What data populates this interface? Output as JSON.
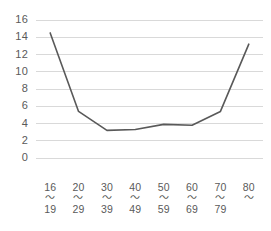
{
  "chart_data": {
    "type": "line",
    "title": "",
    "xlabel": "",
    "ylabel": "",
    "categories": [
      "16\n19",
      "20\n29",
      "30\n39",
      "40\n49",
      "50\n59",
      "60\n69",
      "70\n79",
      "80\n"
    ],
    "category_parts": [
      {
        "top": "16",
        "sep": "〜",
        "bottom": "19"
      },
      {
        "top": "20",
        "sep": "〜",
        "bottom": "29"
      },
      {
        "top": "30",
        "sep": "〜",
        "bottom": "39"
      },
      {
        "top": "40",
        "sep": "〜",
        "bottom": "49"
      },
      {
        "top": "50",
        "sep": "〜",
        "bottom": "59"
      },
      {
        "top": "60",
        "sep": "〜",
        "bottom": "69"
      },
      {
        "top": "70",
        "sep": "〜",
        "bottom": "79"
      },
      {
        "top": "80",
        "sep": "〜",
        "bottom": ""
      }
    ],
    "values": [
      14.5,
      5.4,
      3.2,
      3.3,
      3.9,
      3.8,
      5.4,
      13.2
    ],
    "ylim": [
      0,
      16
    ],
    "yticks": [
      0,
      2,
      4,
      6,
      8,
      10,
      12,
      14,
      16
    ],
    "ytick_labels": [
      "0",
      "2",
      "4",
      "6",
      "8",
      "10",
      "12",
      "14",
      "16"
    ],
    "grid": true,
    "legend": "none",
    "line_color": "#595959",
    "grid_color": "#d9d9d9",
    "axis_color": "#d9d9d9",
    "background": "#ffffff"
  }
}
